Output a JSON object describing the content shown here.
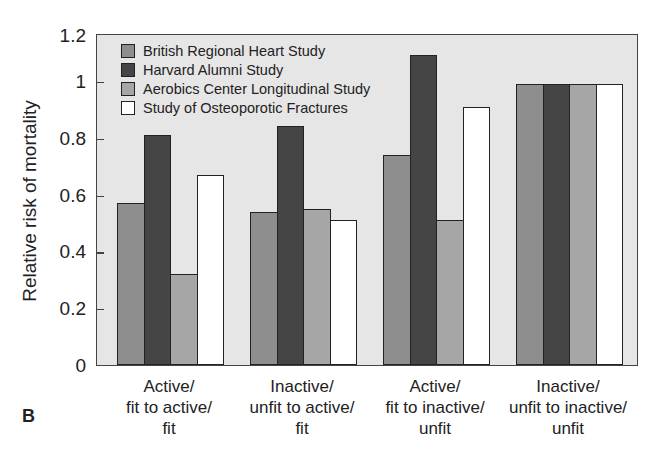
{
  "chart_data": {
    "type": "bar",
    "title": "",
    "panel_label": "B",
    "xlabel": "",
    "ylabel": "Relative risk of mortality",
    "ylim": [
      0,
      1.2
    ],
    "yticks": [
      "0",
      "0.2",
      "0.4",
      "0.6",
      "0.8",
      "1",
      "1.2"
    ],
    "grid": false,
    "legend_position": "upper-left inside",
    "categories": [
      [
        "Active/",
        "fit to active/",
        "fit"
      ],
      [
        "Inactive/",
        "unfit to active/",
        "fit"
      ],
      [
        "Active/",
        "fit to inactive/",
        "unfit"
      ],
      [
        "Inactive/",
        "unfit to inactive/",
        "unfit"
      ]
    ],
    "series": [
      {
        "name": "British Regional Heart Study",
        "color": "#8e8e8e",
        "values": [
          0.57,
          0.54,
          0.74,
          0.99
        ]
      },
      {
        "name": "Harvard Alumni Study",
        "color": "#454545",
        "values": [
          0.81,
          0.84,
          1.09,
          0.99
        ]
      },
      {
        "name": "Aerobics Center Longitudinal Study",
        "color": "#a6a6a6",
        "values": [
          0.32,
          0.55,
          0.51,
          0.99
        ]
      },
      {
        "name": "Study of Osteoporotic Fractures",
        "color": "#ffffff",
        "values": [
          0.67,
          0.51,
          0.91,
          0.99
        ]
      }
    ]
  }
}
